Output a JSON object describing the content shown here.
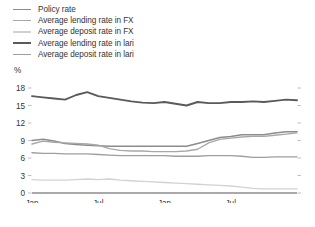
{
  "legend": {
    "position": "top-left",
    "items": [
      {
        "label": "Policy rate",
        "color": "#8c8c8c",
        "width": 1.5
      },
      {
        "label": "Average lending rate in FX",
        "color": "#a8a8a8",
        "width": 1.4
      },
      {
        "label": "Average deposit rate in FX",
        "color": "#d2d2d2",
        "width": 1.4
      },
      {
        "label": "Average lending rate in lari",
        "color": "#5a5a5a",
        "width": 1.9
      },
      {
        "label": "Average deposit rate in lari",
        "color": "#9e9e9e",
        "width": 1.4
      }
    ]
  },
  "axes": {
    "y_unit": "%",
    "y_ticks": [
      "18",
      "15",
      "12",
      "9",
      "6",
      "3",
      "0"
    ],
    "x_ticks": [
      {
        "line1": "Jan",
        "line2": "2020"
      },
      {
        "line1": "Jul",
        "line2": "2020"
      },
      {
        "line1": "Jan",
        "line2": "2021"
      },
      {
        "line1": "Jul",
        "line2": "2021"
      }
    ]
  },
  "chart_data": {
    "type": "line",
    "title": "",
    "subtitle": "",
    "xlabel": "",
    "ylabel": "%",
    "ylim": [
      0,
      18
    ],
    "ytick_values": [
      0,
      3,
      6,
      9,
      12,
      15,
      18
    ],
    "grid": false,
    "legend_position": "top-left",
    "x": [
      "Jan 2020",
      "Feb 2020",
      "Mar 2020",
      "Apr 2020",
      "May 2020",
      "Jun 2020",
      "Jul 2020",
      "Aug 2020",
      "Sep 2020",
      "Oct 2020",
      "Nov 2020",
      "Dec 2020",
      "Jan 2021",
      "Feb 2021",
      "Mar 2021",
      "Apr 2021",
      "May 2021",
      "Jun 2021",
      "Jul 2021",
      "Aug 2021",
      "Sep 2021",
      "Oct 2021",
      "Nov 2021",
      "Dec 2021",
      "Jan 2022"
    ],
    "series": [
      {
        "name": "Policy rate",
        "color": "#8c8c8c",
        "values": [
          9.0,
          9.2,
          8.9,
          8.5,
          8.3,
          8.2,
          8.1,
          8.0,
          8.0,
          8.0,
          8.0,
          8.0,
          8.0,
          8.0,
          8.0,
          8.5,
          9.0,
          9.5,
          9.7,
          10.0,
          10.0,
          10.0,
          10.3,
          10.5,
          10.5
        ]
      },
      {
        "name": "Average lending rate in FX",
        "color": "#a8a8a8",
        "values": [
          8.4,
          8.9,
          8.7,
          8.6,
          8.5,
          8.4,
          8.2,
          7.6,
          7.3,
          7.2,
          7.2,
          7.1,
          7.1,
          7.1,
          7.2,
          7.5,
          8.6,
          9.2,
          9.4,
          9.6,
          9.7,
          9.7,
          9.9,
          10.1,
          10.3
        ]
      },
      {
        "name": "Average deposit rate in FX",
        "color": "#d2d2d2",
        "values": [
          2.3,
          2.2,
          2.2,
          2.2,
          2.3,
          2.4,
          2.3,
          2.4,
          2.2,
          2.1,
          2.0,
          1.9,
          1.8,
          1.7,
          1.6,
          1.5,
          1.4,
          1.3,
          1.2,
          1.0,
          0.8,
          0.7,
          0.7,
          0.7,
          0.7
        ]
      },
      {
        "name": "Average lending rate in lari",
        "color": "#5a5a5a",
        "values": [
          16.6,
          16.4,
          16.2,
          16.0,
          16.8,
          17.3,
          16.6,
          16.3,
          16.0,
          15.7,
          15.5,
          15.4,
          15.6,
          15.3,
          15.0,
          15.6,
          15.4,
          15.4,
          15.6,
          15.6,
          15.7,
          15.6,
          15.8,
          16.0,
          15.9
        ]
      },
      {
        "name": "Average deposit rate in lari",
        "color": "#9e9e9e",
        "values": [
          6.9,
          6.8,
          6.8,
          6.7,
          6.7,
          6.7,
          6.6,
          6.5,
          6.4,
          6.4,
          6.4,
          6.4,
          6.4,
          6.3,
          6.3,
          6.3,
          6.4,
          6.4,
          6.4,
          6.3,
          6.1,
          6.1,
          6.2,
          6.2,
          6.2
        ]
      }
    ]
  }
}
